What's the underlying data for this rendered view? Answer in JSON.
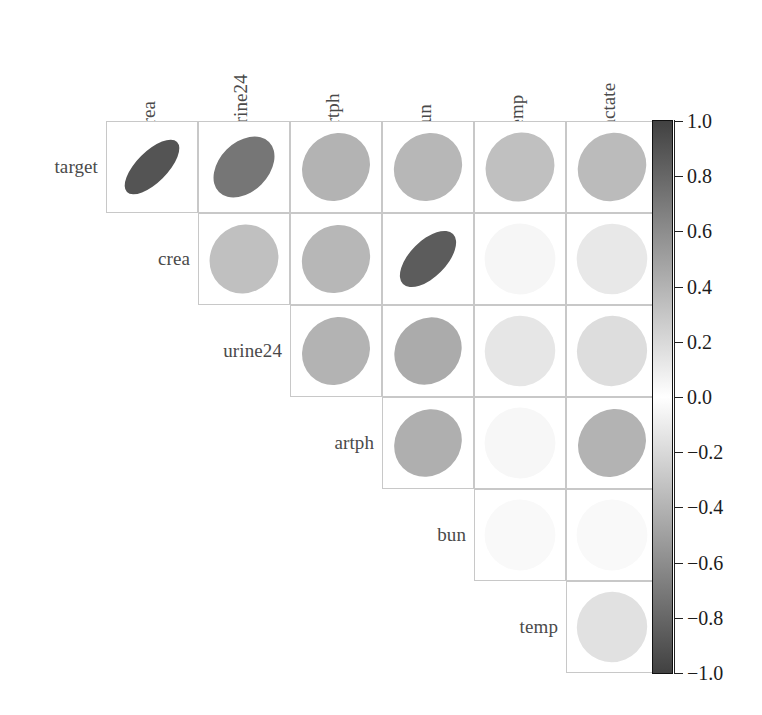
{
  "figure": {
    "type": "correlation-ellipse-matrix",
    "variables": [
      "target",
      "crea",
      "urine24",
      "artph",
      "bun",
      "temp",
      "lactate"
    ],
    "row_labels": [
      "target",
      "crea",
      "urine24",
      "artph",
      "bun",
      "temp"
    ],
    "col_labels": [
      "crea",
      "urine24",
      "artph",
      "bun",
      "temp",
      "lactate"
    ],
    "grid": {
      "left": 106,
      "top": 121,
      "cell": 92,
      "rows": 6,
      "cols": 6,
      "border_color": "#c8c8c8"
    },
    "label_color": "#4a4a4a"
  },
  "chart_data": {
    "type": "heatmap",
    "title": "",
    "xlabel": "",
    "ylabel": "",
    "colorbar": {
      "label": "",
      "vmin": -1.0,
      "vmax": 1.0,
      "ticks": [
        1.0,
        0.8,
        0.6,
        0.4,
        0.2,
        0.0,
        -0.2,
        -0.4,
        -0.6,
        -0.8,
        -1.0
      ],
      "tick_labels": [
        "1.0",
        "0.8",
        "0.6",
        "0.4",
        "0.2",
        "0.0",
        "−0.2",
        "−0.4",
        "−0.6",
        "−0.8",
        "−1.0"
      ],
      "colormap": "diverging-gray (dark at ±1, white at 0)",
      "position": "right"
    },
    "x": [
      "crea",
      "urine24",
      "artph",
      "bun",
      "temp",
      "lactate"
    ],
    "y": [
      "target",
      "crea",
      "urine24",
      "artph",
      "bun",
      "temp"
    ],
    "glyph": "ellipse (tilt = sign of r, eccentricity = |r|, fill = r)",
    "matrix": [
      [
        0.9,
        0.72,
        0.4,
        0.38,
        0.33,
        0.36
      ],
      [
        null,
        0.33,
        0.38,
        0.86,
        0.05,
        0.12
      ],
      [
        null,
        null,
        0.4,
        0.44,
        0.13,
        0.18
      ],
      [
        null,
        null,
        null,
        0.42,
        0.04,
        0.4
      ],
      [
        null,
        null,
        null,
        null,
        0.03,
        0.03
      ],
      [
        null,
        null,
        null,
        null,
        null,
        0.16
      ]
    ],
    "cells": [
      {
        "row": "target",
        "col": "crea",
        "r": 0.9
      },
      {
        "row": "target",
        "col": "urine24",
        "r": 0.72
      },
      {
        "row": "target",
        "col": "artph",
        "r": 0.4
      },
      {
        "row": "target",
        "col": "bun",
        "r": 0.38
      },
      {
        "row": "target",
        "col": "temp",
        "r": 0.33
      },
      {
        "row": "target",
        "col": "lactate",
        "r": 0.36
      },
      {
        "row": "crea",
        "col": "urine24",
        "r": 0.33
      },
      {
        "row": "crea",
        "col": "artph",
        "r": 0.38
      },
      {
        "row": "crea",
        "col": "bun",
        "r": 0.86
      },
      {
        "row": "crea",
        "col": "temp",
        "r": 0.05
      },
      {
        "row": "crea",
        "col": "lactate",
        "r": 0.12
      },
      {
        "row": "urine24",
        "col": "artph",
        "r": 0.4
      },
      {
        "row": "urine24",
        "col": "bun",
        "r": 0.44
      },
      {
        "row": "urine24",
        "col": "temp",
        "r": 0.13
      },
      {
        "row": "urine24",
        "col": "lactate",
        "r": 0.18
      },
      {
        "row": "artph",
        "col": "bun",
        "r": 0.42
      },
      {
        "row": "artph",
        "col": "temp",
        "r": 0.04
      },
      {
        "row": "artph",
        "col": "lactate",
        "r": 0.4
      },
      {
        "row": "bun",
        "col": "temp",
        "r": 0.03
      },
      {
        "row": "bun",
        "col": "lactate",
        "r": 0.03
      },
      {
        "row": "temp",
        "col": "lactate",
        "r": 0.16
      }
    ]
  }
}
